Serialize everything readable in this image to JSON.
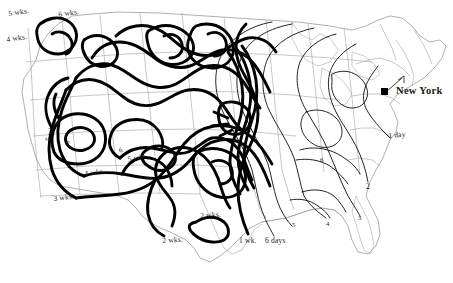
{
  "map": {
    "title": "Isochronic travel-time map of the United States from New York",
    "origin_city": "New York",
    "unit_long": "wks.",
    "unit_short": "days",
    "ink_color": "#101010",
    "border_color": "#9a9a9a",
    "background_color": "#ffffff",
    "projection_note": "conic, continental United States outline with state boundaries"
  },
  "chart_data": {
    "type": "contour-isochrone-map",
    "xlabel": "",
    "ylabel": "",
    "legend": [],
    "origin": {
      "label": "New York",
      "x": 383,
      "y": 92
    },
    "contours": [
      {
        "label": "6 days",
        "value_days": 6,
        "weight": "thin"
      },
      {
        "label": "1 wk.",
        "value_days": 7,
        "weight": "thin"
      },
      {
        "label": "2 wks.",
        "value_days": 14,
        "weight": "thick"
      },
      {
        "label": "3 wks.",
        "value_days": 21,
        "weight": "thick"
      },
      {
        "label": "4 wks.",
        "value_days": 28,
        "weight": "thick"
      },
      {
        "label": "5 wks.",
        "value_days": 35,
        "weight": "thick"
      },
      {
        "label": "6 wks.",
        "value_days": 42,
        "weight": "thick"
      },
      {
        "label": "1 day",
        "value_days": 1,
        "weight": "thin"
      },
      {
        "label": "2",
        "value_days": 2,
        "weight": "thin"
      },
      {
        "label": "3",
        "value_days": 3,
        "weight": "thin"
      },
      {
        "label": "4",
        "value_days": 4,
        "weight": "thin"
      },
      {
        "label": "5",
        "value_days": 5,
        "weight": "thin"
      },
      {
        "label": "6",
        "value_days": 6,
        "weight": "thin"
      }
    ]
  },
  "labels": [
    {
      "id": "l_5wks_nw",
      "text": "5 wks.",
      "x": 8,
      "y": 10,
      "rotate": -8,
      "size": "small"
    },
    {
      "id": "l_6wks_nw",
      "text": "6 wks.",
      "x": 58,
      "y": 11,
      "rotate": -8,
      "size": "small"
    },
    {
      "id": "l_4wks_nw",
      "text": "4 wks.",
      "x": 6,
      "y": 36,
      "rotate": -8,
      "size": "small"
    },
    {
      "id": "l_5wks_nv",
      "text": "5 wks.",
      "x": 44,
      "y": 140,
      "rotate": -72,
      "size": "small"
    },
    {
      "id": "l_6_nv",
      "text": "6",
      "x": 64,
      "y": 142,
      "rotate": -60,
      "size": "tiny"
    },
    {
      "id": "l_4wks_ca",
      "text": "4 wks.",
      "x": 84,
      "y": 170,
      "rotate": -7,
      "size": "small"
    },
    {
      "id": "l_6_ut",
      "text": "6",
      "x": 118,
      "y": 148,
      "rotate": -20,
      "size": "tiny"
    },
    {
      "id": "l_5wks_ut",
      "text": "5 wks.",
      "x": 127,
      "y": 156,
      "rotate": -12,
      "size": "small"
    },
    {
      "id": "l_3wks_sw",
      "text": "3 wks.",
      "x": 53,
      "y": 195,
      "rotate": -6,
      "size": "small"
    },
    {
      "id": "l_2wks_tx_w",
      "text": "2 wks.",
      "x": 162,
      "y": 237,
      "rotate": -4,
      "size": "small"
    },
    {
      "id": "l_2wks_ok",
      "text": "2 wks.",
      "x": 200,
      "y": 212,
      "rotate": -4,
      "size": "small"
    },
    {
      "id": "l_1wk",
      "text": "1 wk.",
      "x": 239,
      "y": 237,
      "rotate": 0,
      "size": "small"
    },
    {
      "id": "l_6days",
      "text": "6 days",
      "x": 265,
      "y": 237,
      "rotate": 0,
      "size": "small"
    },
    {
      "id": "l_5_gulf",
      "text": "5",
      "x": 292,
      "y": 222,
      "rotate": 0,
      "size": "tiny"
    },
    {
      "id": "l_4_gulf",
      "text": "4",
      "x": 326,
      "y": 221,
      "rotate": 0,
      "size": "tiny"
    },
    {
      "id": "l_3_se",
      "text": "3",
      "x": 358,
      "y": 215,
      "rotate": 0,
      "size": "tiny"
    },
    {
      "id": "l_2_se",
      "text": "2",
      "x": 366,
      "y": 183,
      "rotate": 0,
      "size": "small"
    },
    {
      "id": "l_6_ky",
      "text": "6",
      "x": 320,
      "y": 157,
      "rotate": 0,
      "size": "tiny"
    },
    {
      "id": "l_1day",
      "text": "1 day",
      "x": 388,
      "y": 132,
      "rotate": -4,
      "size": "small"
    }
  ],
  "city": {
    "name": "New York",
    "label_x": 396,
    "label_y": 91,
    "dot_x": 385,
    "dot_y": 92
  }
}
